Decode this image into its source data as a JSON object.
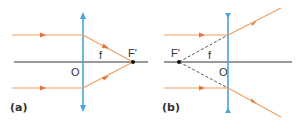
{
  "diagrams": [
    {
      "id": "a",
      "caption": "(a)",
      "lens_type": "converging",
      "labels": {
        "origin": "O",
        "focal_length": "f",
        "focal_point": "F'"
      }
    },
    {
      "id": "b",
      "caption": "(b)",
      "lens_type": "diverging",
      "labels": {
        "origin": "O",
        "focal_length": "f",
        "focal_point": "F'"
      }
    }
  ],
  "colors": {
    "lens": "#4aa3df",
    "ray": "#f0a060",
    "arrowhead": "#e8703a",
    "axis": "#333333",
    "construction": "#555555"
  }
}
